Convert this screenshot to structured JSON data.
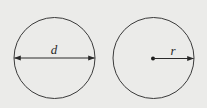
{
  "colors": {
    "background": "#ebebe9",
    "stroke": "#3a3a3a"
  },
  "diagram": {
    "left_circle": {
      "label": "d",
      "meaning": "diameter",
      "center": [
        54.5,
        58
      ],
      "radius": 40.5
    },
    "right_circle": {
      "label": "r",
      "meaning": "radius",
      "center": [
        153.5,
        58
      ],
      "radius": 40.5
    }
  }
}
